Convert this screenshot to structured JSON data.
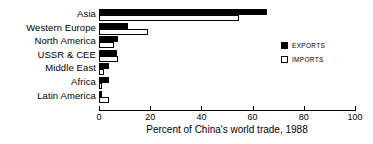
{
  "chart_data": {
    "type": "bar",
    "orientation": "horizontal",
    "title": "",
    "xlabel": "Percent of China's world trade, 1988",
    "ylabel": "",
    "xlim": [
      0,
      100
    ],
    "xticks": [
      0,
      20,
      40,
      60,
      80,
      100
    ],
    "xtick_labels": [
      "0",
      "20",
      "40",
      "60",
      "80",
      "100"
    ],
    "grid": false,
    "legend_position": "right",
    "categories": [
      "Asia",
      "Western Europe",
      "North America",
      "USSR & CEE",
      "Middle East",
      "Africa",
      "Latin America"
    ],
    "series": [
      {
        "name": "EXPORTS",
        "color": "#000000",
        "style": "filled",
        "values": [
          65.5,
          11.5,
          7.5,
          7.0,
          4.0,
          4.0,
          1.0
        ]
      },
      {
        "name": "IMPORTS",
        "color": "#ffffff",
        "style": "hollow",
        "values": [
          54.5,
          19.0,
          6.0,
          7.5,
          2.0,
          1.2,
          4.0
        ]
      }
    ]
  },
  "legend": {
    "items": [
      {
        "label": "EXPORTS",
        "swatch": "filled"
      },
      {
        "label": "IMPORTS",
        "swatch": "hollow"
      }
    ]
  }
}
